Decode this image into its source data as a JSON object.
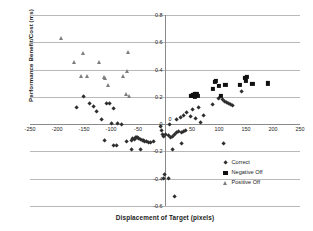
{
  "chart_data": {
    "type": "scatter",
    "title": "",
    "xlabel": "Displacement of Target (pixels)",
    "ylabel": "Performance Benefit/Cost (ms)",
    "xlim": [
      -250,
      250
    ],
    "ylim": [
      -0.6,
      0.8
    ],
    "xticks": [
      -250,
      -200,
      -150,
      -100,
      -50,
      0,
      50,
      100,
      150,
      200,
      250
    ],
    "xtick_labels": [
      "-250",
      "-200",
      "-150",
      "-100",
      "-50",
      "0",
      "50",
      "100",
      "150",
      "200",
      "250"
    ],
    "yticks": [
      0.8,
      0.6,
      0.4,
      0.2,
      0,
      -0.2,
      -0.4,
      -0.6
    ],
    "ytick_labels": [
      "0.8",
      "0.6",
      "0.4",
      "0.2",
      "0",
      "-0.2",
      "-0.4",
      "-0.6"
    ],
    "grid": "horizontal",
    "legend_position": "inside-bottom-right",
    "marker_colors": {
      "correct": "#2e2e2e",
      "negative_off": "#101010",
      "positive_off": "#7d7d7d"
    },
    "series": [
      {
        "name": "Correct",
        "marker": "diamond",
        "points": [
          [
            -150,
            0.205
          ],
          [
            -163,
            0.118
          ],
          [
            -140,
            0.152
          ],
          [
            -132,
            0.125
          ],
          [
            -127,
            0.092
          ],
          [
            -118,
            0.036
          ],
          [
            -108,
            0.152
          ],
          [
            -103,
            0.153
          ],
          [
            -95,
            0.112
          ],
          [
            -98,
            0.005
          ],
          [
            -88,
            0.001
          ],
          [
            -80,
            -0.002
          ],
          [
            -112,
            -0.122
          ],
          [
            -90,
            -0.155
          ],
          [
            -72,
            -0.125
          ],
          [
            -62,
            -0.123
          ],
          [
            -60,
            -0.108
          ],
          [
            -57,
            -0.112
          ],
          [
            -55,
            -0.1
          ],
          [
            -52,
            -0.098
          ],
          [
            -50,
            -0.102
          ],
          [
            -48,
            -0.108
          ],
          [
            -45,
            -0.115
          ],
          [
            -42,
            -0.118
          ],
          [
            -40,
            -0.124
          ],
          [
            -37,
            -0.128
          ],
          [
            -34,
            -0.13
          ],
          [
            -30,
            -0.133
          ],
          [
            -26,
            -0.132
          ],
          [
            -22,
            -0.128
          ],
          [
            -62,
            -0.188
          ],
          [
            -96,
            -0.16
          ],
          [
            -45,
            -0.185
          ],
          [
            -8,
            -0.02
          ],
          [
            -6,
            -0.048
          ],
          [
            -4,
            -0.075
          ],
          [
            -2,
            -0.09
          ],
          [
            2,
            -0.08
          ],
          [
            6,
            -0.085
          ],
          [
            10,
            -0.095
          ],
          [
            14,
            -0.09
          ],
          [
            18,
            -0.078
          ],
          [
            22,
            -0.06
          ],
          [
            26,
            -0.055
          ],
          [
            30,
            -0.06
          ],
          [
            34,
            -0.055
          ],
          [
            38,
            -0.05
          ],
          [
            14,
            -0.188
          ],
          [
            30,
            -0.145
          ],
          [
            8,
            -0.002
          ],
          [
            22,
            0.03
          ],
          [
            28,
            0.048
          ],
          [
            34,
            0.062
          ],
          [
            40,
            0.085
          ],
          [
            48,
            0.055
          ],
          [
            52,
            0.105
          ],
          [
            56,
            0.04
          ],
          [
            62,
            0.122
          ],
          [
            66,
            0.012
          ],
          [
            72,
            0.062
          ],
          [
            88,
            0.145
          ],
          [
            100,
            0.19
          ],
          [
            106,
            0.178
          ],
          [
            110,
            0.168
          ],
          [
            114,
            0.158
          ],
          [
            118,
            0.15
          ],
          [
            122,
            0.142
          ],
          [
            126,
            0.138
          ],
          [
            108,
            -0.14
          ],
          [
            142,
            0.238
          ],
          [
            -1,
            -0.368
          ],
          [
            6,
            -0.398
          ],
          [
            -3,
            -0.4
          ],
          [
            18,
            -0.53
          ]
        ]
      },
      {
        "name": "Negative Off",
        "marker": "square",
        "points": [
          [
            48,
            0.205
          ],
          [
            50,
            0.208
          ],
          [
            51,
            0.212
          ],
          [
            53,
            0.215
          ],
          [
            55,
            0.218
          ],
          [
            56,
            0.198
          ],
          [
            58,
            0.222
          ],
          [
            60,
            0.208
          ],
          [
            92,
            0.31
          ],
          [
            95,
            0.318
          ],
          [
            88,
            0.258
          ],
          [
            100,
            0.282
          ],
          [
            104,
            0.205
          ],
          [
            112,
            0.288
          ],
          [
            138,
            0.285
          ],
          [
            148,
            0.34
          ],
          [
            152,
            0.348
          ],
          [
            150,
            0.318
          ],
          [
            162,
            0.292
          ],
          [
            190,
            0.298
          ]
        ]
      },
      {
        "name": "Positive Off",
        "marker": "triangle",
        "points": [
          [
            -192,
            0.635
          ],
          [
            -168,
            0.455
          ],
          [
            -152,
            0.518
          ],
          [
            -155,
            0.352
          ],
          [
            -145,
            0.352
          ],
          [
            -122,
            0.452
          ],
          [
            -113,
            0.348
          ],
          [
            -112,
            0.338
          ],
          [
            -105,
            0.288
          ],
          [
            -68,
            0.53
          ],
          [
            -70,
            0.392
          ],
          [
            -72,
            0.222
          ],
          [
            -66,
            0.205
          ],
          [
            -78,
            0.352
          ]
        ]
      }
    ]
  },
  "legend": {
    "items": [
      {
        "label": "Correct",
        "marker": "diamond"
      },
      {
        "label": "Negative Off",
        "marker": "square"
      },
      {
        "label": "Positive Off",
        "marker": "triangle"
      }
    ]
  }
}
